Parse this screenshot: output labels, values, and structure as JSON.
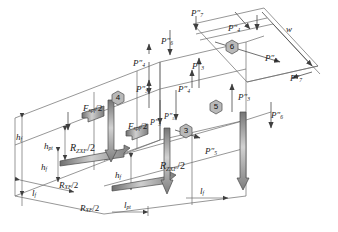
{
  "figure": {
    "type": "isometric-force-diagram",
    "colors": {
      "line": "#555555",
      "arrow_fill": "#9a9a9a",
      "arrow_stroke": "#4a4a4a",
      "hexagon_fill": "#b9b9b9",
      "hexagon_stroke": "#5a5a5a",
      "text": "#1a1a1a",
      "background": "#ffffff"
    },
    "node_markers": [
      {
        "id": "m3",
        "label": "3",
        "x": 186,
        "y": 131
      },
      {
        "id": "m4",
        "label": "4",
        "x": 118,
        "y": 98
      },
      {
        "id": "m5",
        "label": "5",
        "x": 216,
        "y": 107
      },
      {
        "id": "m6",
        "label": "6",
        "x": 232,
        "y": 47
      }
    ],
    "load_labels": [
      {
        "id": "p7-topleft",
        "name": "P",
        "primes": "″",
        "sub": "7",
        "x": 191,
        "y": 9
      },
      {
        "id": "p4-top",
        "name": "P",
        "primes": "″",
        "sub": "4",
        "x": 228,
        "y": 24
      },
      {
        "id": "w-top",
        "name": "w",
        "primes": "",
        "sub": "",
        "x": 286,
        "y": 25
      },
      {
        "id": "p4-mid",
        "name": "P",
        "primes": "″",
        "sub": "4",
        "x": 265,
        "y": 54
      },
      {
        "id": "p7-right",
        "name": "P",
        "primes": "″",
        "sub": "7",
        "x": 290,
        "y": 74
      },
      {
        "id": "p6-upper",
        "name": "P",
        "primes": "″",
        "sub": "6",
        "x": 161,
        "y": 37
      },
      {
        "id": "p4-left",
        "name": "P",
        "primes": "″",
        "sub": "4",
        "x": 133,
        "y": 59
      },
      {
        "id": "p3-left",
        "name": "P",
        "primes": "″",
        "sub": "3",
        "x": 136,
        "y": 85
      },
      {
        "id": "p3-mid",
        "name": "P",
        "primes": "″",
        "sub": "3",
        "x": 192,
        "y": 62
      },
      {
        "id": "p4-lower",
        "name": "P",
        "primes": "″",
        "sub": "4",
        "x": 178,
        "y": 85
      },
      {
        "id": "p3-right",
        "name": "P",
        "primes": "″",
        "sub": "3",
        "x": 238,
        "y": 93
      },
      {
        "id": "p6-right",
        "name": "P",
        "primes": "″",
        "sub": "6",
        "x": 271,
        "y": 111
      },
      {
        "id": "p5-mid",
        "name": "P",
        "primes": "″",
        "sub": "5",
        "x": 164,
        "y": 113
      },
      {
        "id": "p5-right",
        "name": "P",
        "primes": "″",
        "sub": "5",
        "x": 205,
        "y": 147
      },
      {
        "id": "p3-inner",
        "name": "P",
        "primes": "″",
        "sub": "3",
        "x": 150,
        "y": 119
      }
    ],
    "force_labels": [
      {
        "id": "fxpf-upper",
        "name": "F",
        "sub": "xpf",
        "div": "/2",
        "x": 83,
        "y": 108
      },
      {
        "id": "fxpf-lower",
        "name": "F",
        "sub": "xpf",
        "div": "/2",
        "x": 128,
        "y": 125
      },
      {
        "id": "rzxf-left",
        "name": "R",
        "sub": "ZXF",
        "div": "/2",
        "x": 74,
        "y": 148
      },
      {
        "id": "rzxf-right",
        "name": "R",
        "sub": "ZXF",
        "div": "/2",
        "x": 164,
        "y": 165
      },
      {
        "id": "rxf-left",
        "name": "R",
        "sub": "XF",
        "div": "/2",
        "x": 63,
        "y": 185
      },
      {
        "id": "rxf-lower",
        "name": "R",
        "sub": "XF",
        "div": "/2",
        "x": 84,
        "y": 208
      }
    ],
    "dimension_labels": [
      {
        "id": "hf-outer",
        "name": "h",
        "sub": "f",
        "x": 20,
        "y": 137
      },
      {
        "id": "hpt",
        "name": "h",
        "sub": "pt",
        "x": 48,
        "y": 146
      },
      {
        "id": "hf-mid",
        "name": "h",
        "sub": "f",
        "x": 44,
        "y": 167
      },
      {
        "id": "lf-left",
        "name": "l",
        "sub": "f",
        "x": 34,
        "y": 193
      },
      {
        "id": "hf-right",
        "name": "h",
        "sub": "f",
        "x": 118,
        "y": 175
      },
      {
        "id": "lpt",
        "name": "l",
        "sub": "pt",
        "x": 127,
        "y": 205
      },
      {
        "id": "lf-right",
        "name": "l",
        "sub": "f",
        "x": 203,
        "y": 200
      }
    ]
  }
}
